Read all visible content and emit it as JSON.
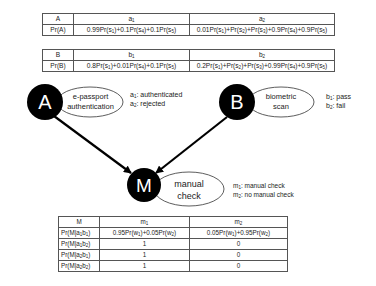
{
  "table_a": {
    "header": [
      "A",
      "a1",
      "a2"
    ],
    "row_label": "Pr(A)",
    "values": [
      "0.99Pr(s1)+0.1Pr(s4)+0.1Pr(s5)",
      "0.01Pr(s1)+Pr(s2)+Pr(s3)+0.9Pr(s4)+0.9Pr(s5)"
    ]
  },
  "table_b": {
    "header": [
      "B",
      "b1",
      "b2"
    ],
    "row_label": "Pr(B)",
    "values": [
      "0.8Pr(s1)+0.01Pr(s4)+0.1Pr(s5)",
      "0.2Pr(s1)+Pr(s2)+Pr(s3)+0.99Pr(s4)+0.9Pr(s5)"
    ]
  },
  "nodes": {
    "A": {
      "letter": "A",
      "label_line1": "e-passport",
      "label_line2": "authentication",
      "states": [
        "a1: authenticated",
        "a2: rejected"
      ]
    },
    "B": {
      "letter": "B",
      "label_line1": "biometric",
      "label_line2": "scan",
      "states": [
        "b1: pass",
        "b2: fail"
      ]
    },
    "M": {
      "letter": "M",
      "label_line1": "manual",
      "label_line2": "check",
      "states": [
        "m1: manual check",
        "m2: no manual check"
      ]
    }
  },
  "edges": [
    {
      "from": "A",
      "to": "M"
    },
    {
      "from": "B",
      "to": "M"
    }
  ],
  "table_m": {
    "header": [
      "M",
      "m1",
      "m2"
    ],
    "rows": [
      {
        "label": "Pr(M|a1b1)",
        "m1": "0.95Pr(w1)+0.05Pr(w2)",
        "m2": "0.05Pr(w1)+0.95Pr(w2)"
      },
      {
        "label": "Pr(M|a1b2)",
        "m1": "1",
        "m2": "0"
      },
      {
        "label": "Pr(M|a2b1)",
        "m1": "1",
        "m2": "0"
      },
      {
        "label": "Pr(M|a2b2)",
        "m1": "1",
        "m2": "0"
      }
    ]
  }
}
